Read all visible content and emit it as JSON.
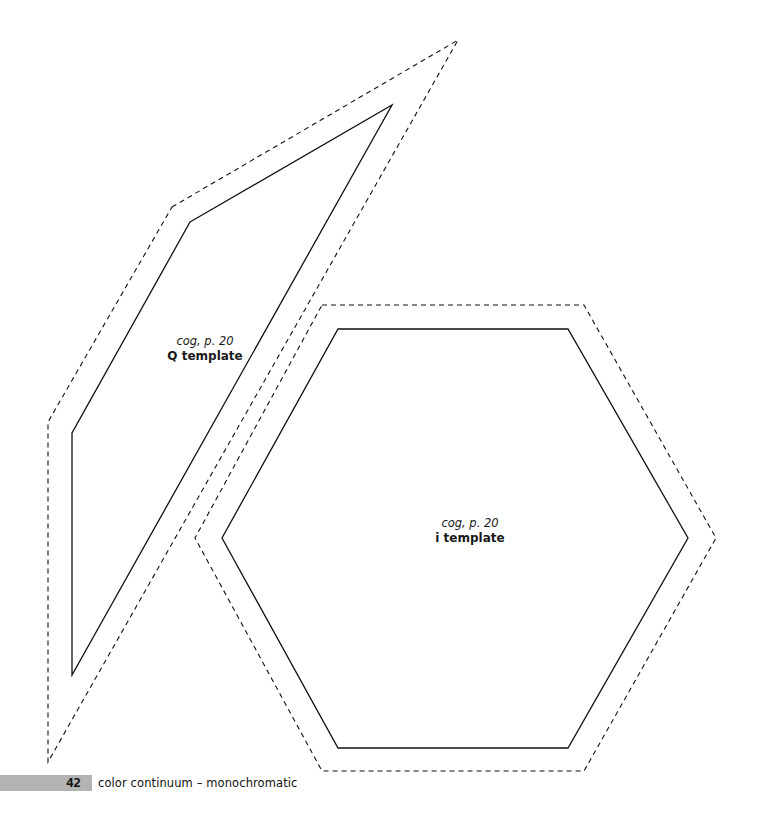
{
  "page": {
    "number": "42",
    "title": "color continuum – monochromatic"
  },
  "templates": {
    "q": {
      "reference": "cog, p. 20",
      "name": "Q template"
    },
    "i": {
      "reference": "cog, p. 20",
      "name": "i template"
    }
  },
  "colors": {
    "line": "#111111",
    "footer_bar": "#b3b3b3"
  }
}
